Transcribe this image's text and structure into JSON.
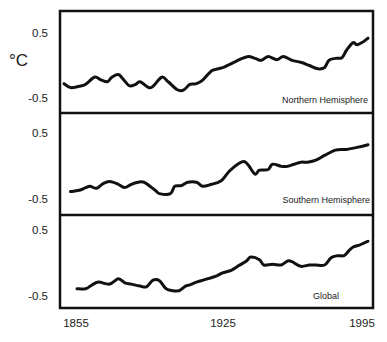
{
  "figure": {
    "unit_label": "°C",
    "x_ticks": [
      "1855",
      "1925",
      "1995"
    ],
    "panels": [
      {
        "name": "Northern Hemisphere",
        "y_ticks": [
          "0.5",
          "-0.5"
        ]
      },
      {
        "name": "Southern Hemisphere",
        "y_ticks": [
          "0.5",
          "-0.5"
        ]
      },
      {
        "name": "Global",
        "y_ticks": [
          "0.5",
          "-0.5"
        ]
      }
    ]
  },
  "chart_data": [
    {
      "type": "line",
      "title": "Northern Hemisphere",
      "xlabel": "",
      "ylabel": "°C",
      "xlim": [
        1855,
        1995
      ],
      "ylim": [
        -0.8,
        0.8
      ],
      "x_ticks": [
        1855,
        1925,
        1995
      ],
      "y_ticks": [
        0.5,
        -0.5
      ],
      "grid": false,
      "series": [
        {
          "name": "Northern Hemisphere",
          "x": [
            1855,
            1858,
            1862,
            1865,
            1869,
            1872,
            1875,
            1877,
            1880,
            1882,
            1885,
            1888,
            1890,
            1894,
            1896,
            1900,
            1903,
            1907,
            1910,
            1913,
            1916,
            1919,
            1923,
            1926,
            1929,
            1934,
            1937,
            1940,
            1943,
            1946,
            1949,
            1953,
            1956,
            1960,
            1964,
            1968,
            1972,
            1975,
            1977,
            1980,
            1983,
            1985,
            1988,
            1990,
            1993,
            1995
          ],
          "values": [
            -0.28,
            -0.34,
            -0.32,
            -0.29,
            -0.18,
            -0.22,
            -0.25,
            -0.18,
            -0.14,
            -0.2,
            -0.31,
            -0.29,
            -0.25,
            -0.34,
            -0.32,
            -0.18,
            -0.25,
            -0.37,
            -0.38,
            -0.29,
            -0.28,
            -0.22,
            -0.08,
            -0.05,
            -0.02,
            0.06,
            0.11,
            0.14,
            0.11,
            0.08,
            0.14,
            0.09,
            0.14,
            0.08,
            0.05,
            0.0,
            -0.05,
            -0.03,
            0.08,
            0.11,
            0.12,
            0.23,
            0.35,
            0.32,
            0.37,
            0.42
          ]
        }
      ]
    },
    {
      "type": "line",
      "title": "Southern Hemisphere",
      "xlabel": "",
      "ylabel": "°C",
      "xlim": [
        1855,
        1995
      ],
      "ylim": [
        -0.8,
        0.8
      ],
      "x_ticks": [
        1855,
        1925,
        1995
      ],
      "y_ticks": [
        0.5,
        -0.5
      ],
      "grid": false,
      "series": [
        {
          "name": "Southern Hemisphere",
          "x": [
            1858,
            1862,
            1865,
            1867,
            1870,
            1873,
            1876,
            1880,
            1883,
            1886,
            1889,
            1892,
            1897,
            1899,
            1904,
            1906,
            1909,
            1912,
            1916,
            1919,
            1923,
            1926,
            1928,
            1931,
            1935,
            1938,
            1940,
            1943,
            1945,
            1949,
            1951,
            1955,
            1958,
            1961,
            1964,
            1967,
            1971,
            1975,
            1980,
            1985,
            1990,
            1995
          ],
          "values": [
            -0.39,
            -0.37,
            -0.33,
            -0.31,
            -0.34,
            -0.27,
            -0.24,
            -0.28,
            -0.33,
            -0.28,
            -0.25,
            -0.25,
            -0.37,
            -0.42,
            -0.42,
            -0.31,
            -0.3,
            -0.25,
            -0.25,
            -0.31,
            -0.28,
            -0.25,
            -0.21,
            -0.09,
            0.02,
            0.06,
            0.0,
            -0.13,
            -0.07,
            -0.06,
            0.02,
            -0.01,
            -0.01,
            0.02,
            0.05,
            0.05,
            0.08,
            0.15,
            0.23,
            0.24,
            0.27,
            0.31
          ]
        }
      ]
    },
    {
      "type": "line",
      "title": "Global",
      "xlabel": "",
      "ylabel": "°C",
      "xlim": [
        1855,
        1995
      ],
      "ylim": [
        -0.8,
        0.8
      ],
      "x_ticks": [
        1855,
        1925,
        1995
      ],
      "y_ticks": [
        0.5,
        -0.5
      ],
      "grid": false,
      "series": [
        {
          "name": "Global",
          "x": [
            1861,
            1865,
            1868,
            1871,
            1876,
            1880,
            1883,
            1886,
            1890,
            1893,
            1896,
            1899,
            1902,
            1905,
            1908,
            1911,
            1913,
            1916,
            1919,
            1922,
            1925,
            1928,
            1932,
            1935,
            1939,
            1941,
            1945,
            1947,
            1951,
            1955,
            1958,
            1960,
            1964,
            1968,
            1971,
            1975,
            1978,
            1981,
            1984,
            1986,
            1988,
            1991,
            1993,
            1995
          ],
          "values": [
            -0.39,
            -0.39,
            -0.33,
            -0.29,
            -0.32,
            -0.24,
            -0.3,
            -0.32,
            -0.35,
            -0.36,
            -0.26,
            -0.27,
            -0.39,
            -0.42,
            -0.42,
            -0.35,
            -0.33,
            -0.29,
            -0.26,
            -0.23,
            -0.2,
            -0.15,
            -0.11,
            -0.05,
            0.03,
            0.09,
            0.05,
            -0.03,
            -0.02,
            -0.03,
            0.03,
            0.02,
            -0.05,
            -0.03,
            -0.03,
            -0.03,
            0.08,
            0.11,
            0.11,
            0.18,
            0.24,
            0.27,
            0.3,
            0.33
          ]
        }
      ]
    }
  ]
}
